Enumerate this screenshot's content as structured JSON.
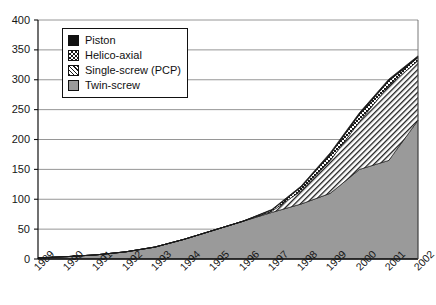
{
  "chart_data": {
    "type": "area",
    "stacked": true,
    "title": "",
    "xlabel": "",
    "ylabel": "",
    "categories": [
      "1989",
      "1990",
      "1991",
      "1992",
      "1993",
      "1994",
      "1995",
      "1996",
      "1997",
      "1998",
      "1999",
      "2000",
      "2001",
      "2002"
    ],
    "ylim": [
      0,
      400
    ],
    "ytick_values": [
      0,
      50,
      100,
      150,
      200,
      250,
      300,
      350,
      400
    ],
    "ytick_labels": [
      "0",
      "50",
      "100",
      "150",
      "200",
      "250",
      "300",
      "350",
      "400"
    ],
    "grid": "horizontal",
    "legend_position": "upper-left-inside",
    "series": [
      {
        "name": "Twin-screw",
        "pattern": "solid-gray",
        "color": "#9a9a9a",
        "values": [
          2,
          4,
          7,
          12,
          20,
          33,
          48,
          63,
          78,
          92,
          110,
          150,
          165,
          232
        ]
      },
      {
        "name": "Single-screw (PCP)",
        "pattern": "diagonal-hatch",
        "color": "#ffffff",
        "values": [
          0,
          0,
          0,
          0,
          0,
          0,
          0,
          0,
          2,
          22,
          55,
          80,
          125,
          100
        ]
      },
      {
        "name": "Helico-axial",
        "pattern": "checkerboard",
        "color": "#ffffff",
        "values": [
          0,
          0,
          0,
          0,
          0,
          0,
          0,
          0,
          2,
          6,
          10,
          12,
          8,
          5
        ]
      },
      {
        "name": "Piston",
        "pattern": "solid-black",
        "color": "#111111",
        "values": [
          0,
          0,
          0,
          0,
          0,
          0,
          0,
          0,
          1,
          2,
          3,
          3,
          3,
          3
        ]
      }
    ],
    "totals": [
      2,
      4,
      7,
      12,
      20,
      33,
      48,
      63,
      83,
      122,
      178,
      245,
      301,
      340
    ]
  },
  "legend": {
    "items": [
      {
        "label": "Piston"
      },
      {
        "label": "Helico-axial"
      },
      {
        "label": "Single-screw (PCP)"
      },
      {
        "label": "Twin-screw"
      }
    ]
  },
  "colors": {
    "axis": "#111111",
    "grid": "#8a8a8a",
    "twin_screw": "#9a9a9a",
    "piston": "#111111",
    "plot_background": "#ffffff"
  }
}
